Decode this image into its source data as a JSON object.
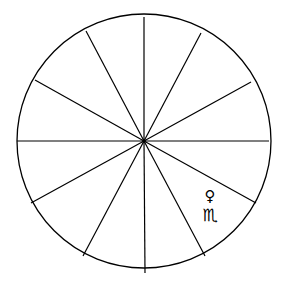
{
  "chart_wheel": {
    "center": [
      144,
      141
    ],
    "radius": 127,
    "stroke_color": "#000000",
    "background": "#ffffff",
    "spokes": [
      [
        144,
        17
      ],
      [
        201,
        33
      ],
      [
        251,
        82
      ],
      [
        269,
        141
      ],
      [
        256,
        203
      ],
      [
        205,
        256
      ],
      [
        145,
        273
      ],
      [
        83,
        256
      ],
      [
        31,
        203
      ],
      [
        17,
        141
      ],
      [
        35,
        80
      ],
      [
        86,
        31
      ]
    ],
    "symbols": {
      "planet": "♀",
      "planet_name": "venus-icon",
      "sign": "♏",
      "sign_name": "scorpio-icon"
    }
  }
}
